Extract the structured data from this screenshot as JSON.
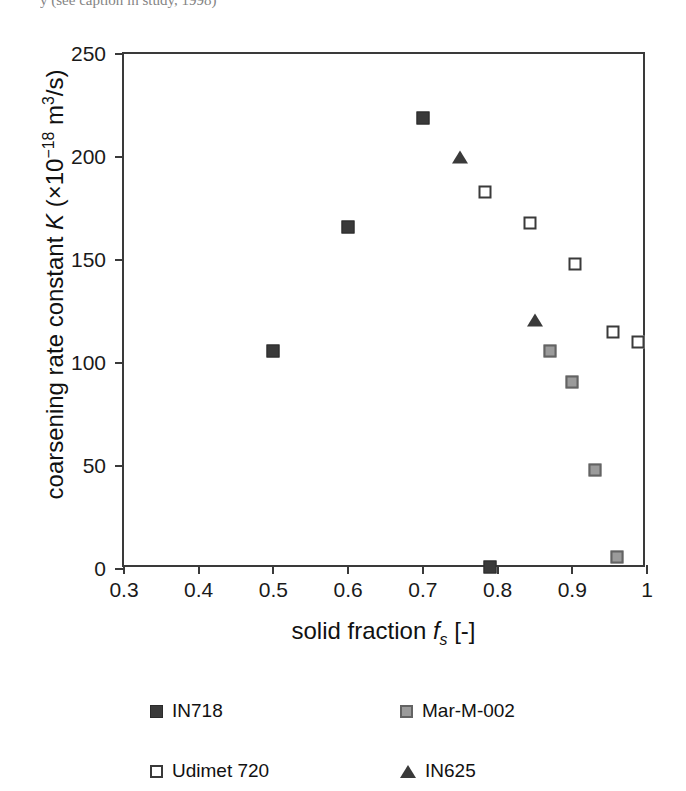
{
  "top_caption": "y (see caption in study, 1998)",
  "axes": {
    "x_title_prefix": "solid fraction ",
    "x_title_symbol": "f",
    "x_title_sub": "s",
    "x_title_suffix": " [-]",
    "y_title_prefix": "coarsening rate constant ",
    "y_title_symbol": "K",
    "y_title_open": " (×10",
    "y_title_exp": "−18",
    "y_title_close": " m",
    "y_title_exp2": "3",
    "y_title_tail": "/s)"
  },
  "legend": {
    "position": "below-axis",
    "items": [
      {
        "label": "IN718",
        "marker": "filled-square",
        "color": "#3a3a3a"
      },
      {
        "label": "Mar-M-002",
        "marker": "gray-square",
        "color": "#9b9b9b"
      },
      {
        "label": "Udimet 720",
        "marker": "open-square",
        "color": "#ffffff"
      },
      {
        "label": "IN625",
        "marker": "filled-triangle",
        "color": "#3a3a3a"
      }
    ]
  },
  "chart_data": {
    "type": "scatter",
    "title": "",
    "xlabel": "solid fraction f_s [-]",
    "ylabel": "coarsening rate constant K (×10^-18 m^3/s)",
    "xlim": [
      0.3,
      1.0
    ],
    "ylim": [
      0,
      250
    ],
    "xticks": [
      0.3,
      0.4,
      0.5,
      0.6,
      0.7,
      0.8,
      0.9,
      1
    ],
    "xtick_labels": [
      "0.3",
      "0.4",
      "0.5",
      "0.6",
      "0.7",
      "0.8",
      "0.9",
      "1"
    ],
    "yticks": [
      0,
      50,
      100,
      150,
      200,
      250
    ],
    "ytick_labels": [
      "0",
      "50",
      "100",
      "150",
      "200",
      "250"
    ],
    "grid": false,
    "series": [
      {
        "name": "IN718",
        "marker": "filled-square",
        "color": "#3a3a3a",
        "points": [
          {
            "x": 0.5,
            "y": 106
          },
          {
            "x": 0.6,
            "y": 166
          },
          {
            "x": 0.7,
            "y": 219
          },
          {
            "x": 0.79,
            "y": 1
          }
        ]
      },
      {
        "name": "Mar-M-002",
        "marker": "gray-square",
        "color": "#9b9b9b",
        "points": [
          {
            "x": 0.87,
            "y": 106
          },
          {
            "x": 0.9,
            "y": 91
          },
          {
            "x": 0.93,
            "y": 48
          },
          {
            "x": 0.96,
            "y": 6
          }
        ]
      },
      {
        "name": "Udimet 720",
        "marker": "open-square",
        "color": "#ffffff",
        "points": [
          {
            "x": 0.783,
            "y": 183
          },
          {
            "x": 0.843,
            "y": 168
          },
          {
            "x": 0.903,
            "y": 148
          },
          {
            "x": 0.955,
            "y": 115
          },
          {
            "x": 0.988,
            "y": 110
          }
        ]
      },
      {
        "name": "IN625",
        "marker": "filled-triangle",
        "color": "#3a3a3a",
        "points": [
          {
            "x": 0.75,
            "y": 200
          },
          {
            "x": 0.85,
            "y": 121
          }
        ]
      }
    ]
  }
}
